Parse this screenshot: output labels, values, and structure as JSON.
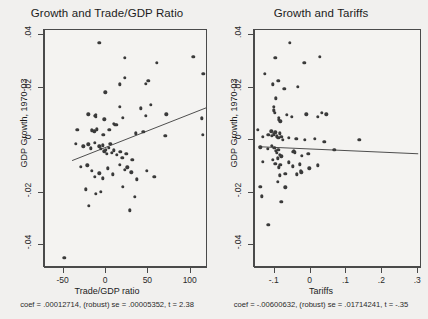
{
  "chart_data": [
    {
      "type": "scatter",
      "panel": "left",
      "title": "Growth and Trade/GDP Ratio",
      "xlabel": "Trade/GDP ratio",
      "ylabel": "GDP Growth, 1970-03",
      "xlim": [
        -72,
        118
      ],
      "ylim": [
        -0.048,
        0.042
      ],
      "xticks": [
        -50,
        0,
        50,
        100
      ],
      "xticklabels": [
        "-50",
        "0",
        "50",
        "100"
      ],
      "yticks": [
        0.04,
        0.02,
        0,
        -0.02,
        -0.04
      ],
      "yticklabels": [
        ".04",
        ".02",
        "0",
        "-.02",
        "-.04"
      ],
      "grid": false,
      "legend": null,
      "marker_color": "#3a3a3a",
      "line_color": "#3b3b3b",
      "fit": {
        "coef": 0.00012714,
        "se": 5.352e-05,
        "t": 2.38,
        "robust": true,
        "x_start": -40,
        "x_end": 118,
        "y_start": -0.0078,
        "y_end": 0.0123
      },
      "note": "coef = .00012714, (robust) se = .00005352, t = 2.38",
      "points": [
        [
          -8.0,
          0.0372
        ],
        [
          22.0,
          0.0315
        ],
        [
          60.0,
          0.0294
        ],
        [
          103.0,
          0.0317
        ],
        [
          16.0,
          0.0213
        ],
        [
          22.0,
          0.0238
        ],
        [
          47.0,
          0.0214
        ],
        [
          50.0,
          0.0226
        ],
        [
          115.0,
          0.0253
        ],
        [
          -1.0,
          0.0183
        ],
        [
          -21.0,
          0.0098
        ],
        [
          -13.0,
          0.0092
        ],
        [
          -12.0,
          0.0096
        ],
        [
          -12.0,
          0.0088
        ],
        [
          16.0,
          0.0127
        ],
        [
          20.0,
          0.0086
        ],
        [
          41.0,
          0.0122
        ],
        [
          53.0,
          0.0134
        ],
        [
          47.0,
          0.0092
        ],
        [
          71.0,
          0.0098
        ],
        [
          113.0,
          0.0083
        ],
        [
          -34.0,
          0.0039
        ],
        [
          -17.0,
          0.0038
        ],
        [
          -14.0,
          0.0034
        ],
        [
          -11.0,
          0.0041
        ],
        [
          -2.0,
          0.0079
        ],
        [
          -3.0,
          0.0021
        ],
        [
          4.0,
          0.004
        ],
        [
          9.0,
          0.0063
        ],
        [
          11.0,
          0.0059
        ],
        [
          13.0,
          0.0058
        ],
        [
          35.0,
          0.0026
        ],
        [
          44.0,
          0.0031
        ],
        [
          70.0,
          0.0017
        ],
        [
          114.0,
          0.002
        ],
        [
          -36.0,
          -0.0013
        ],
        [
          -27.0,
          -0.0024
        ],
        [
          -21.0,
          -0.0016
        ],
        [
          -18.0,
          -0.0031
        ],
        [
          -13.0,
          -0.001
        ],
        [
          -8.0,
          -0.0024
        ],
        [
          -6.0,
          -0.0032
        ],
        [
          -4.0,
          -0.0019
        ],
        [
          -2.0,
          -0.0042
        ],
        [
          0.0,
          -0.0036
        ],
        [
          1.0,
          -0.0051
        ],
        [
          3.0,
          -0.0029
        ],
        [
          5.0,
          -0.0014
        ],
        [
          7.0,
          -0.0048
        ],
        [
          9.0,
          -0.0039
        ],
        [
          13.0,
          -0.0057
        ],
        [
          17.0,
          -0.0044
        ],
        [
          19.0,
          -0.0067
        ],
        [
          24.0,
          -0.0052
        ],
        [
          31.0,
          -0.0075
        ],
        [
          -30.0,
          -0.0102
        ],
        [
          -22.0,
          -0.0096
        ],
        [
          -17.0,
          -0.0118
        ],
        [
          -13.0,
          -0.014
        ],
        [
          -8.0,
          -0.0127
        ],
        [
          -4.0,
          -0.0145
        ],
        [
          2.0,
          -0.0108
        ],
        [
          8.0,
          -0.0131
        ],
        [
          16.0,
          -0.0094
        ],
        [
          22.0,
          -0.0114
        ],
        [
          25.0,
          -0.0103
        ],
        [
          30.0,
          -0.0122
        ],
        [
          36.0,
          -0.0149
        ],
        [
          48.0,
          -0.0118
        ],
        [
          57.0,
          -0.0141
        ],
        [
          -24.0,
          -0.0188
        ],
        [
          -12.0,
          -0.0204
        ],
        [
          -6.0,
          -0.0196
        ],
        [
          20.0,
          -0.0178
        ],
        [
          34.0,
          -0.0215
        ],
        [
          -20.0,
          -0.0251
        ],
        [
          28.0,
          -0.0268
        ],
        [
          -49.0,
          -0.0448
        ]
      ]
    },
    {
      "type": "scatter",
      "panel": "right",
      "title": "Growth and Tariffs",
      "xlabel": "Tariffs",
      "ylabel": "GDP Growth, 1970-03",
      "xlim": [
        -0.155,
        0.305
      ],
      "ylim": [
        -0.048,
        0.042
      ],
      "xticks": [
        -0.1,
        0,
        0.1,
        0.2,
        0.3
      ],
      "xticklabels": [
        "-.1",
        "0",
        ".1",
        ".2",
        ".3"
      ],
      "yticks": [
        0.04,
        0.02,
        0,
        -0.02,
        -0.04
      ],
      "yticklabels": [
        ".04",
        ".02",
        "0",
        "-.02",
        "-.04"
      ],
      "grid": false,
      "legend": null,
      "marker_color": "#3a3a3a",
      "line_color": "#3b3b3b",
      "fit": {
        "coef": -0.00600632,
        "se": 0.01714241,
        "t": -0.35,
        "robust": true,
        "x_start": -0.145,
        "x_end": 0.3,
        "y_start": -0.0025,
        "y_end": -0.0052
      },
      "note": "coef = -.00600632, (robust) se = .01714241, t = -.35",
      "points": [
        [
          -0.058,
          0.0372
        ],
        [
          -0.098,
          0.0315
        ],
        [
          -0.018,
          0.0294
        ],
        [
          0.026,
          0.0317
        ],
        [
          -0.128,
          0.0253
        ],
        [
          -0.105,
          0.0213
        ],
        [
          -0.09,
          0.0226
        ],
        [
          -0.073,
          0.0196
        ],
        [
          -0.035,
          0.0204
        ],
        [
          -0.097,
          0.016
        ],
        [
          -0.103,
          0.0126
        ],
        [
          -0.102,
          0.0114
        ],
        [
          -0.1,
          0.0104
        ],
        [
          -0.067,
          0.0097
        ],
        [
          -0.088,
          0.0086
        ],
        [
          -0.088,
          0.0078
        ],
        [
          -0.084,
          0.0072
        ],
        [
          -0.053,
          0.009
        ],
        [
          -0.012,
          0.0098
        ],
        [
          0.02,
          0.009
        ],
        [
          0.032,
          0.0104
        ],
        [
          0.044,
          0.0098
        ],
        [
          -0.147,
          0.004
        ],
        [
          -0.133,
          0.0013
        ],
        [
          -0.118,
          0.0021
        ],
        [
          -0.11,
          0.0034
        ],
        [
          -0.108,
          0.0016
        ],
        [
          -0.103,
          0.0022
        ],
        [
          -0.098,
          0.003
        ],
        [
          -0.094,
          0.0014
        ],
        [
          -0.09,
          0.0008
        ],
        [
          -0.086,
          0.0026
        ],
        [
          -0.082,
          0.0012
        ],
        [
          -0.078,
          0.0002
        ],
        [
          -0.061,
          0.001
        ],
        [
          -0.04,
          0.0006
        ],
        [
          -0.016,
          0.0002
        ],
        [
          0.012,
          0.0006
        ],
        [
          0.038,
          -0.0006
        ],
        [
          0.136,
          0.0002
        ],
        [
          -0.14,
          -0.0028
        ],
        [
          -0.12,
          -0.0034
        ],
        [
          -0.108,
          -0.0022
        ],
        [
          -0.101,
          -0.003
        ],
        [
          -0.097,
          -0.0041
        ],
        [
          -0.094,
          -0.0048
        ],
        [
          -0.09,
          -0.0036
        ],
        [
          -0.086,
          -0.0056
        ],
        [
          -0.082,
          -0.0062
        ],
        [
          -0.05,
          -0.0044
        ],
        [
          -0.046,
          -0.004
        ],
        [
          -0.044,
          -0.0046
        ],
        [
          -0.024,
          -0.006
        ],
        [
          -0.006,
          -0.0052
        ],
        [
          0.066,
          -0.0038
        ],
        [
          -0.133,
          -0.0082
        ],
        [
          -0.105,
          -0.0076
        ],
        [
          -0.098,
          -0.009
        ],
        [
          -0.092,
          -0.007
        ],
        [
          -0.088,
          -0.0104
        ],
        [
          -0.084,
          -0.0094
        ],
        [
          -0.06,
          -0.0084
        ],
        [
          -0.05,
          -0.01
        ],
        [
          -0.028,
          -0.0116
        ],
        [
          -0.03,
          -0.0092
        ],
        [
          -0.004,
          -0.0108
        ],
        [
          0.02,
          -0.0096
        ],
        [
          -0.086,
          -0.0134
        ],
        [
          -0.07,
          -0.0128
        ],
        [
          -0.038,
          -0.013
        ],
        [
          -0.026,
          -0.0122
        ],
        [
          -0.092,
          -0.016
        ],
        [
          -0.14,
          -0.0178
        ],
        [
          -0.07,
          -0.018
        ],
        [
          -0.136,
          -0.0214
        ],
        [
          -0.082,
          -0.0236
        ],
        [
          -0.118,
          -0.0322
        ]
      ]
    }
  ]
}
